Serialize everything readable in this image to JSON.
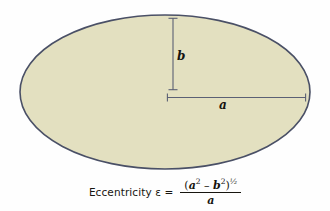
{
  "figure": {
    "type": "ellipse-diagram",
    "caption_formula": {
      "lhs_text": "Eccentricity",
      "eccentricity_symbol": "ε",
      "equals_sign": "=",
      "numerator_text": "(a2 − b2)1/2",
      "denominator_text": "a",
      "full_text": "Eccentricity ε = (a² − b²)^(1/2) / a",
      "numerator_parts": {
        "open_paren": "(",
        "term1_base": "a",
        "term1_exp": "2",
        "operator": "–",
        "term2_base": "b",
        "term2_exp": "2",
        "close_paren": ")",
        "outer_exp_num": "1",
        "outer_exp_slash": "/",
        "outer_exp_den": "2"
      }
    },
    "labels": {
      "semi_minor": "b",
      "semi_major": "a"
    },
    "colors": {
      "fill": "#e3e0c0",
      "stroke": "#4a5066",
      "axis_line": "#565c70",
      "background": "#fefefe",
      "text": "#17150f"
    },
    "geometry": {
      "center_x": 165,
      "center_y": 92,
      "radius_x": 145,
      "radius_y": 77
    }
  }
}
